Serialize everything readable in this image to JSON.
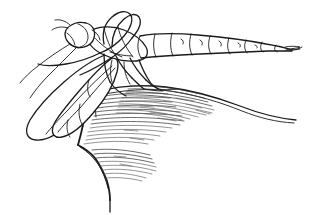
{
  "artwork": {
    "title": "Dragonfly perched on rock edge",
    "medium": "pen-and-ink line drawing",
    "background_color": "#ffffff",
    "ink_color": "#1a1a1a",
    "hatch_color": "#3a3a3a",
    "canvas": {
      "width": 318,
      "height": 215
    }
  },
  "subjects": {
    "insect": {
      "name": "dragonfly",
      "label": "dragonfly",
      "parts": [
        {
          "name": "head",
          "label": "head"
        },
        {
          "name": "compound-eye",
          "label": "compound eye"
        },
        {
          "name": "thorax",
          "label": "thorax"
        },
        {
          "name": "abdomen",
          "label": "abdomen"
        },
        {
          "name": "forewing",
          "label": "forewing"
        },
        {
          "name": "hindwing",
          "label": "hindwing"
        },
        {
          "name": "legs",
          "label": "legs"
        },
        {
          "name": "cerci",
          "label": "cerci"
        }
      ],
      "abdomen_segment_count": 9,
      "wing_count": 2,
      "leg_count": 6
    },
    "substrate": {
      "name": "rock",
      "label": "rock ledge",
      "shading": "horizontal hatching"
    }
  }
}
